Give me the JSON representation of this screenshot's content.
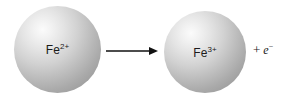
{
  "diagram": {
    "background_color": "#ffffff",
    "ink_color": "#1b1b1b",
    "reactant": {
      "element": "Fe",
      "charge": "2+",
      "sphere_fill_light": "#fbfbfb",
      "sphere_fill_dark": "#949494"
    },
    "arrow": {
      "direction": "right",
      "color": "#111111"
    },
    "product": {
      "element": "Fe",
      "charge": "3+",
      "sphere_fill_light": "#fbfbfb",
      "sphere_fill_dark": "#949494"
    },
    "electron": {
      "operator": "+",
      "symbol": "e",
      "charge": "−"
    }
  }
}
